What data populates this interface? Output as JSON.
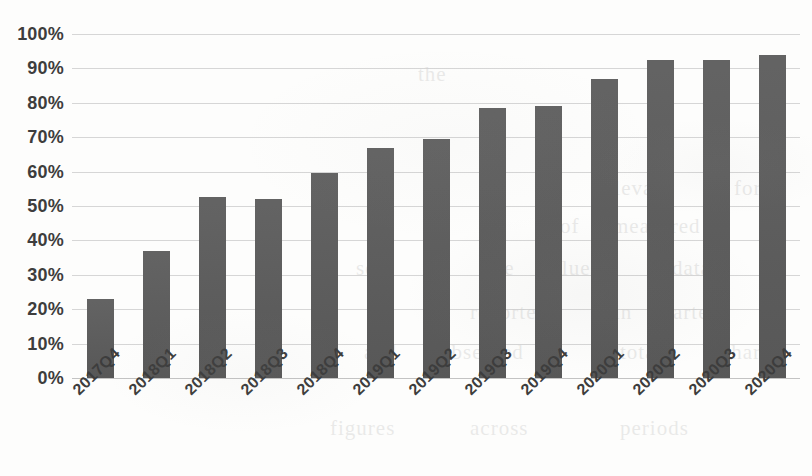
{
  "chart_data": {
    "type": "bar",
    "title": "",
    "xlabel": "",
    "ylabel": "",
    "categories": [
      "2017Q4",
      "2018Q1",
      "2018Q2",
      "2018Q3",
      "2018Q4",
      "2019Q1",
      "2019Q2",
      "2019Q3",
      "2019Q4",
      "2020Q1",
      "2020Q2",
      "2020Q3",
      "2020Q4"
    ],
    "values": [
      23,
      37,
      52.5,
      52,
      59.5,
      67,
      69.5,
      78.5,
      79,
      87,
      92.5,
      92.5,
      94
    ],
    "value_labels": [
      "23%",
      "37%",
      "52.5%",
      "52%",
      "59.5%",
      "67%",
      "69.5%",
      "78.5%",
      "79%",
      "87%",
      "92.5%",
      "92.5%",
      "94%"
    ],
    "ylim": [
      0,
      100
    ],
    "ytick_labels": [
      "100%",
      "90%",
      "80%",
      "70%",
      "60%",
      "50%",
      "40%",
      "30%",
      "20%",
      "10%",
      "0%"
    ],
    "ytick_values": [
      100,
      90,
      80,
      70,
      60,
      50,
      40,
      30,
      20,
      10,
      0
    ],
    "grid": true,
    "legend": false,
    "legend_position": "none",
    "series": [
      {
        "name": "",
        "values": [
          23,
          37,
          52.5,
          52,
          59.5,
          67,
          69.5,
          78.5,
          79,
          87,
          92.5,
          92.5,
          94
        ]
      }
    ],
    "colors": {
      "bar": "#5b5b5b",
      "gridline": "#cfcfcf",
      "axis_text": "#3d3d3d",
      "background": "#fdfdfc"
    }
  },
  "artifacts": {
    "bleed_text": [
      {
        "text": "the",
        "x": 418,
        "y": 62
      },
      {
        "text": "relevant",
        "x": 596,
        "y": 176
      },
      {
        "text": "for",
        "x": 734,
        "y": 176
      },
      {
        "text": "of",
        "x": 560,
        "y": 214
      },
      {
        "text": "measured",
        "x": 612,
        "y": 214
      },
      {
        "text": "set",
        "x": 356,
        "y": 256
      },
      {
        "text": "the",
        "x": 486,
        "y": 256
      },
      {
        "text": "values",
        "x": 540,
        "y": 256
      },
      {
        "text": "data",
        "x": 672,
        "y": 256
      },
      {
        "text": "reported",
        "x": 470,
        "y": 300
      },
      {
        "text": "in",
        "x": 614,
        "y": 300
      },
      {
        "text": "quarter",
        "x": 650,
        "y": 300
      },
      {
        "text": "and",
        "x": 364,
        "y": 340
      },
      {
        "text": "observed",
        "x": 440,
        "y": 340
      },
      {
        "text": "totals",
        "x": 620,
        "y": 340
      },
      {
        "text": "share",
        "x": 722,
        "y": 340
      },
      {
        "text": "figures",
        "x": 330,
        "y": 416
      },
      {
        "text": "across",
        "x": 470,
        "y": 416
      },
      {
        "text": "periods",
        "x": 620,
        "y": 416
      }
    ]
  }
}
